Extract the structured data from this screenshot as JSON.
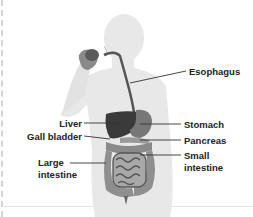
{
  "diagram": {
    "labels": {
      "esophagus": "Esophagus",
      "liver": "Liver",
      "gall_bladder": "Gall bladder",
      "large_intestine_line1": "Large",
      "large_intestine_line2": "intestine",
      "stomach": "Stomach",
      "pancreas": "Pancreas",
      "small_intestine_line1": "Small",
      "small_intestine_line2": "intestine"
    },
    "colors": {
      "silhouette": "#e6e6e6",
      "organ_dark": "#3a3a3a",
      "organ_mid": "#777777",
      "intestine": "#9a9a9a",
      "leader_line": "#333333"
    }
  }
}
